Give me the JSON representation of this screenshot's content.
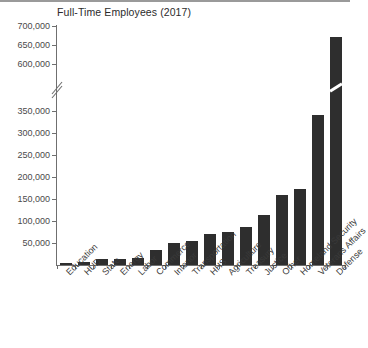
{
  "chart_data": {
    "type": "bar",
    "title": "Full-Time Employees (2017)",
    "xlabel": "",
    "ylabel": "",
    "categories": [
      "Education",
      "HUD",
      "State",
      "Energy",
      "Labor",
      "Commerce",
      "Interior",
      "Transportation",
      "HHS",
      "Agriculture",
      "Treasury",
      "Justice",
      "Other",
      "Homeland Security",
      "Veterans Affairs",
      "Defense"
    ],
    "values": [
      4000,
      7500,
      13000,
      14500,
      15000,
      33000,
      50000,
      55000,
      70000,
      75000,
      86000,
      113000,
      160000,
      172000,
      340000,
      672000
    ],
    "ytick_labels": [
      "50,000",
      "100,000",
      "150,000",
      "200,000",
      "250,000",
      "300,000",
      "350,000",
      "600,000",
      "650,000",
      "700,000"
    ],
    "ytick_values": [
      50000,
      100000,
      150000,
      200000,
      250000,
      300000,
      350000,
      600000,
      650000,
      700000
    ],
    "ylim": [
      0,
      700000
    ],
    "axis_break": {
      "from": 360000,
      "to": 590000,
      "marker": "zigzag"
    },
    "grid": false,
    "legend": null,
    "bar_color": "#2e2e2e",
    "axis_color": "#6f6f6f"
  }
}
